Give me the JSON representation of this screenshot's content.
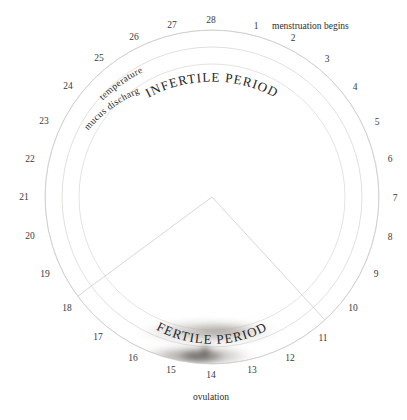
{
  "diagram": {
    "title_menstruation": "menstruation begins",
    "label_ovulation": "ovulation",
    "label_infertile": "INFERTILE PERIOD",
    "label_fertile": "FERTILE PERIOD",
    "label_temperature": "temperature",
    "label_mucus": "mucus discharge",
    "center": {
      "x": 212,
      "y": 197
    },
    "radii": {
      "outer": 167,
      "middle": 150,
      "inner": 133
    },
    "fertile_wedge": {
      "start_day": 11,
      "end_day": 17
    },
    "colors": {
      "ring": "#d8d6d2",
      "text": "#2e2e2e",
      "smudge_temperature": "#b9b5b0",
      "smudge_mucus": "#8e8a86",
      "background": "#ffffff"
    },
    "days": [
      {
        "n": "1",
        "x": 256,
        "y": 29
      },
      {
        "n": "2",
        "x": 293,
        "y": 41
      },
      {
        "n": "3",
        "x": 327,
        "y": 62
      },
      {
        "n": "4",
        "x": 355,
        "y": 90
      },
      {
        "n": "5",
        "x": 377,
        "y": 125
      },
      {
        "n": "6",
        "x": 390,
        "y": 162
      },
      {
        "n": "7",
        "x": 395,
        "y": 201
      },
      {
        "n": "8",
        "x": 390,
        "y": 240
      },
      {
        "n": "9",
        "x": 376,
        "y": 277
      },
      {
        "n": "10",
        "x": 353,
        "y": 311
      },
      {
        "n": "11",
        "x": 323,
        "y": 341
      },
      {
        "n": "12",
        "x": 290,
        "y": 361
      },
      {
        "n": "13",
        "x": 252,
        "y": 373
      },
      {
        "n": "14",
        "x": 211,
        "y": 378
      },
      {
        "n": "15",
        "x": 171,
        "y": 373
      },
      {
        "n": "16",
        "x": 133,
        "y": 361
      },
      {
        "n": "17",
        "x": 98,
        "y": 340
      },
      {
        "n": "18",
        "x": 67,
        "y": 311
      },
      {
        "n": "19",
        "x": 45,
        "y": 277
      },
      {
        "n": "20",
        "x": 30,
        "y": 239
      },
      {
        "n": "21",
        "x": 24,
        "y": 200
      },
      {
        "n": "22",
        "x": 30,
        "y": 162
      },
      {
        "n": "23",
        "x": 44,
        "y": 124
      },
      {
        "n": "24",
        "x": 68,
        "y": 89
      },
      {
        "n": "25",
        "x": 99,
        "y": 61
      },
      {
        "n": "26",
        "x": 134,
        "y": 40
      },
      {
        "n": "27",
        "x": 172,
        "y": 28
      },
      {
        "n": "28",
        "x": 211,
        "y": 23
      }
    ]
  }
}
